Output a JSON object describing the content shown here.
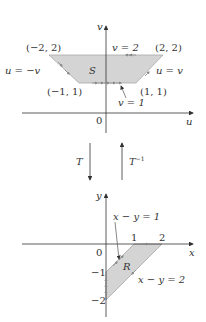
{
  "colors": {
    "region_fill": "#d4d4d4",
    "axis": "#333333",
    "edge": "#9a9a9a",
    "arrow_mark": "#7a7a7a",
    "text": "#333333"
  },
  "top_plane": {
    "name": "uv-plane",
    "axis_labels": {
      "vertical": "v",
      "horizontal": "u",
      "origin": "0"
    },
    "region_label": "S",
    "vertex_labels": {
      "top_left": "(−2, 2)",
      "top_right": "(2, 2)",
      "bottom_left": "(−1, 1)",
      "bottom_right": "(1, 1)"
    },
    "edge_labels": {
      "top": "v = 2",
      "left": "u = −v",
      "right": "u = v",
      "bottom": "v = 1"
    }
  },
  "transforms": {
    "forward": "T",
    "inverse": "T",
    "inverse_superscript": "−1"
  },
  "bottom_plane": {
    "name": "xy-plane",
    "axis_labels": {
      "vertical": "y",
      "horizontal": "x",
      "origin": "0"
    },
    "region_label": "R",
    "ticks": {
      "x1": "1",
      "x2": "2",
      "y_neg1": "−1",
      "y_neg2": "−2"
    },
    "edge_labels": {
      "upper": "x − y = 1",
      "lower": "x − y = 2"
    }
  }
}
